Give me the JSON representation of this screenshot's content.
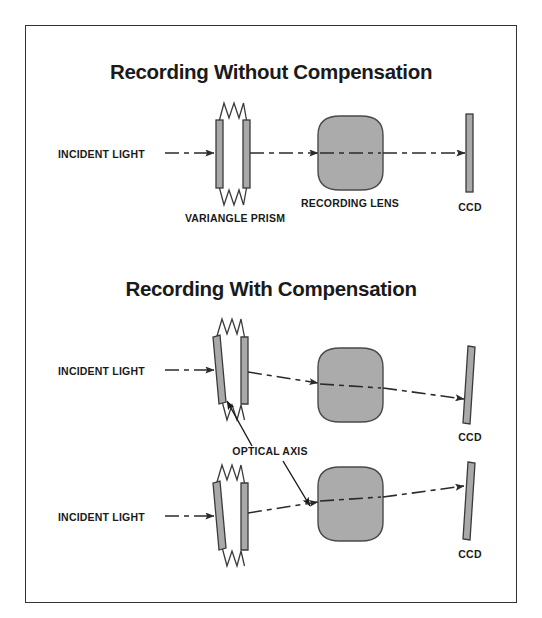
{
  "figure": {
    "border_color": "#333333",
    "background": "#ffffff",
    "glass_fill": "#a9a9a9",
    "lens_fill": "#ababab",
    "ink_color": "#1a1a1a"
  },
  "sections": [
    {
      "id": "without-compensation",
      "title": "Recording Without Compensation",
      "labels": {
        "incident_light": "INCIDENT LIGHT",
        "prism": "VARIANGLE PRISM",
        "lens": "RECORDING LENS",
        "ccd": "CCD"
      }
    },
    {
      "id": "with-compensation",
      "title": "Recording With Compensation",
      "labels": {
        "incident_light": "INCIDENT LIGHT",
        "optical_axis": "OPTICAL AXIS",
        "ccd": "CCD"
      }
    }
  ],
  "rows": [
    {
      "id": "row-uncompensated",
      "incident_light": "INCIDENT LIGHT",
      "prism_label": "VARIANGLE PRISM",
      "lens_label": "RECORDING LENS",
      "ccd_label": "CCD",
      "prism_tilt_deg": 0,
      "ccd_tilt_deg": 0,
      "beam_deflection": "none"
    },
    {
      "id": "row-compensated-down",
      "incident_light": "INCIDENT LIGHT",
      "ccd_label": "CCD",
      "prism_tilt_deg": 8,
      "ccd_tilt_deg": 8,
      "beam_deflection": "down"
    },
    {
      "id": "row-compensated-up",
      "incident_light": "INCIDENT LIGHT",
      "ccd_label": "CCD",
      "prism_tilt_deg": 8,
      "ccd_tilt_deg": 8,
      "beam_deflection": "up"
    }
  ],
  "annotations": {
    "optical_axis": "OPTICAL AXIS"
  }
}
